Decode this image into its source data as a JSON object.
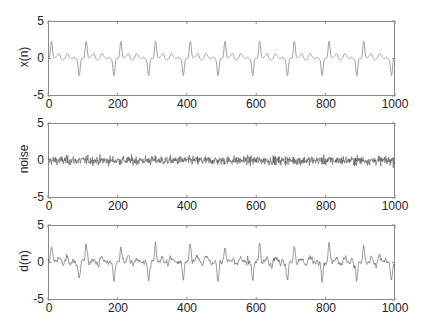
{
  "chart_data": [
    {
      "type": "line",
      "title": "",
      "xlabel": "",
      "ylabel": "x(n)",
      "xlim": [
        0,
        1000
      ],
      "ylim": [
        -5,
        5
      ],
      "xticks": [
        0,
        200,
        400,
        600,
        800,
        1000
      ],
      "yticks": [
        -5,
        0,
        5
      ],
      "grid": false,
      "color": "#a0a0a0",
      "description": "Periodic deterministic signal, period ~100 samples, amplitude between about -2.5 and +2.5; sharp peak (~2.5) near n=10,110,210,..., smaller ripples (~0.5) after it, and trough (~-2.5) near n=90,190,...",
      "series": [
        {
          "name": "x(n)",
          "period": 100,
          "peak": 2.5,
          "trough": -2.5
        }
      ]
    },
    {
      "type": "line",
      "title": "",
      "xlabel": "",
      "ylabel": "noise",
      "xlim": [
        0,
        1000
      ],
      "ylim": [
        -5,
        5
      ],
      "xticks": [
        0,
        200,
        400,
        600,
        800,
        1000
      ],
      "yticks": [
        -5,
        0,
        5
      ],
      "grid": false,
      "color": "#555555",
      "description": "Random noise centered at 0, values roughly within -1.7 to +2",
      "series": [
        {
          "name": "noise",
          "mean": 0,
          "std": 0.6
        }
      ]
    },
    {
      "type": "line",
      "title": "",
      "xlabel": "",
      "ylabel": "d(n)",
      "xlim": [
        0,
        1000
      ],
      "ylim": [
        -5,
        5
      ],
      "xticks": [
        0,
        200,
        400,
        600,
        800,
        1000
      ],
      "yticks": [
        -5,
        0,
        5
      ],
      "grid": false,
      "color": "#555555",
      "description": "d(n) = x(n) + noise; peaks near 3-4 around n=110,210,...,810, troughs near -3 to -3.5 around n=90,190,...,890",
      "series": [
        {
          "name": "d(n)",
          "range": [
            -3.7,
            4
          ]
        }
      ]
    }
  ],
  "panels": [
    {
      "ylabel": "x(n)",
      "yticks": [
        "5",
        "0",
        "-5"
      ],
      "xticks": [
        "0",
        "200",
        "400",
        "600",
        "800",
        "1000"
      ]
    },
    {
      "ylabel": "noise",
      "yticks": [
        "5",
        "0",
        "-5"
      ],
      "xticks": [
        "0",
        "200",
        "400",
        "600",
        "800",
        "1000"
      ]
    },
    {
      "ylabel": "d(n)",
      "yticks": [
        "5",
        "0",
        "-5"
      ],
      "xticks": [
        "0",
        "200",
        "400",
        "600",
        "800",
        "1000"
      ]
    }
  ]
}
